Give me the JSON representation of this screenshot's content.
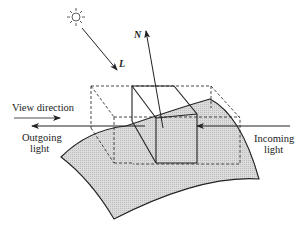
{
  "figure": {
    "type": "diagram",
    "colors": {
      "surface_fill": "#d6d6d6",
      "stroke": "#222222",
      "dashed_stroke": "#333333",
      "background": "#ffffff"
    },
    "icons": {
      "light_source": "sun-icon"
    },
    "vectors": {
      "light": {
        "label": "L"
      },
      "normal": {
        "label": "N"
      }
    },
    "labels": {
      "view_direction": "View direction",
      "outgoing_line1": "Outgoing",
      "outgoing_line2": "light",
      "incoming_line1": "Incoming",
      "incoming_line2": "light"
    }
  }
}
